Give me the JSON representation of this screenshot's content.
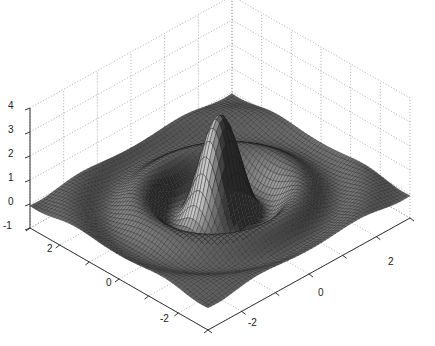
{
  "chart_data": {
    "type": "surface",
    "title": "",
    "xlabel": "",
    "ylabel": "",
    "zlabel": "",
    "function": "sombrero-like radial ripple: central peak ~3.5 with concentric damped rings",
    "x_range": [
      -3,
      3
    ],
    "y_range": [
      -3,
      3
    ],
    "zlim": [
      -1,
      4
    ],
    "x_ticks": [
      -2,
      0,
      2
    ],
    "y_ticks": [
      -2,
      0,
      2
    ],
    "z_ticks": [
      -1,
      0,
      1,
      2,
      3,
      4
    ],
    "peak_value": 3.5,
    "grid": true,
    "colormap": "grayscale mesh",
    "view": "3D isometric (MATLAB default az=-37.5, el=30 style)"
  },
  "axes": {
    "z_labels": [
      "4",
      "3",
      "2",
      "1",
      "0",
      "-1"
    ],
    "left_labels": [
      "2",
      "0",
      "-2"
    ],
    "right_labels": [
      "-2",
      "0",
      "2"
    ]
  }
}
